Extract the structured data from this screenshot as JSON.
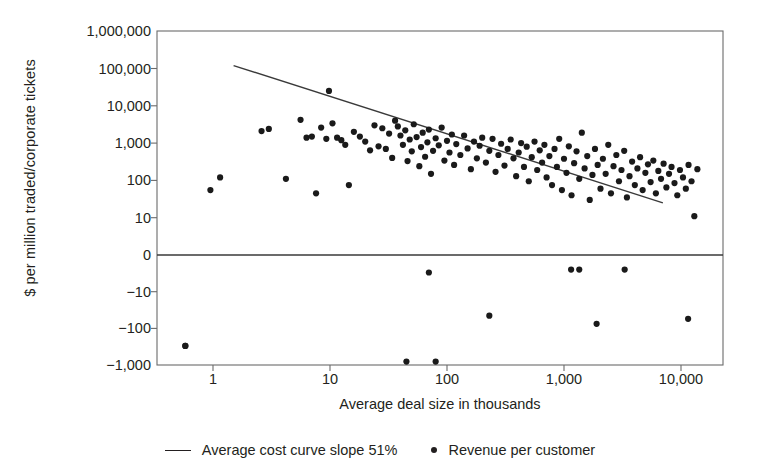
{
  "chart_data": {
    "type": "scatter",
    "title": "",
    "xlabel": "Average deal size in thousands",
    "ylabel": "$ per million traded/corporate tickets",
    "xscale": "log",
    "yscale": "symlog",
    "xlim": [
      0.45,
      17000
    ],
    "ylim": [
      -1000,
      1000000
    ],
    "grid": false,
    "legend_position": "bottom-center",
    "xticks": [
      {
        "value": 1,
        "label": "1"
      },
      {
        "value": 10,
        "label": "10"
      },
      {
        "value": 100,
        "label": "100"
      },
      {
        "value": 1000,
        "label": "1,000"
      },
      {
        "value": 10000,
        "label": "10,000"
      }
    ],
    "yticks": [
      {
        "value": 1000000,
        "label": "1,000,000"
      },
      {
        "value": 100000,
        "label": "100,000"
      },
      {
        "value": 10000,
        "label": "10,000"
      },
      {
        "value": 1000,
        "label": "1,000"
      },
      {
        "value": 100,
        "label": "100"
      },
      {
        "value": 10,
        "label": "10"
      },
      {
        "value": 0,
        "label": "0"
      },
      {
        "value": -10,
        "label": "−10"
      },
      {
        "value": -100,
        "label": "−100"
      },
      {
        "value": -1000,
        "label": "−1,000"
      }
    ],
    "legend": [
      {
        "marker": "line",
        "label": "Average cost curve slope 51%"
      },
      {
        "marker": "dot",
        "label": "Revenue per customer"
      }
    ],
    "series": [
      {
        "name": "Average cost curve slope 51%",
        "type": "line",
        "slope_percent": 51,
        "points": [
          {
            "x": 1.5,
            "y": 120000
          },
          {
            "x": 7000,
            "y": 25
          }
        ]
      },
      {
        "name": "Revenue per customer",
        "type": "scatter",
        "points": [
          {
            "x": 0.58,
            "y": -300
          },
          {
            "x": 0.95,
            "y": 55
          },
          {
            "x": 1.15,
            "y": 120
          },
          {
            "x": 2.6,
            "y": 2100
          },
          {
            "x": 3.0,
            "y": 2400
          },
          {
            "x": 4.2,
            "y": 110
          },
          {
            "x": 5.6,
            "y": 4200
          },
          {
            "x": 6.3,
            "y": 1400
          },
          {
            "x": 7.0,
            "y": 1500
          },
          {
            "x": 7.6,
            "y": 45
          },
          {
            "x": 8.4,
            "y": 2600
          },
          {
            "x": 9.3,
            "y": 1300
          },
          {
            "x": 9.8,
            "y": 25000
          },
          {
            "x": 10.5,
            "y": 3400
          },
          {
            "x": 11.5,
            "y": 1400
          },
          {
            "x": 12.5,
            "y": 1200
          },
          {
            "x": 13.5,
            "y": 900
          },
          {
            "x": 14.5,
            "y": 75
          },
          {
            "x": 16,
            "y": 2000
          },
          {
            "x": 18,
            "y": 1500
          },
          {
            "x": 20,
            "y": 1100
          },
          {
            "x": 22,
            "y": 640
          },
          {
            "x": 24,
            "y": 3000
          },
          {
            "x": 26,
            "y": 820
          },
          {
            "x": 28,
            "y": 2500
          },
          {
            "x": 30,
            "y": 700
          },
          {
            "x": 32,
            "y": 1800
          },
          {
            "x": 34,
            "y": 400
          },
          {
            "x": 36,
            "y": 4000
          },
          {
            "x": 38,
            "y": 2800
          },
          {
            "x": 40,
            "y": 1600
          },
          {
            "x": 42,
            "y": 900
          },
          {
            "x": 44,
            "y": 2200
          },
          {
            "x": 46,
            "y": 330
          },
          {
            "x": 48,
            "y": 1250
          },
          {
            "x": 50,
            "y": 600
          },
          {
            "x": 52,
            "y": 3200
          },
          {
            "x": 55,
            "y": 1450
          },
          {
            "x": 58,
            "y": 240
          },
          {
            "x": 60,
            "y": 780
          },
          {
            "x": 62,
            "y": 1900
          },
          {
            "x": 65,
            "y": 430
          },
          {
            "x": 68,
            "y": 1050
          },
          {
            "x": 70,
            "y": 2300
          },
          {
            "x": 73,
            "y": 150
          },
          {
            "x": 76,
            "y": 620
          },
          {
            "x": 80,
            "y": 1350
          },
          {
            "x": 85,
            "y": 870
          },
          {
            "x": 90,
            "y": 2600
          },
          {
            "x": 95,
            "y": 340
          },
          {
            "x": 100,
            "y": 1150
          },
          {
            "x": 105,
            "y": 560
          },
          {
            "x": 110,
            "y": 1700
          },
          {
            "x": 115,
            "y": 260
          },
          {
            "x": 120,
            "y": 940
          },
          {
            "x": 130,
            "y": 480
          },
          {
            "x": 140,
            "y": 1600
          },
          {
            "x": 150,
            "y": 720
          },
          {
            "x": 160,
            "y": 200
          },
          {
            "x": 170,
            "y": 1100
          },
          {
            "x": 180,
            "y": 390
          },
          {
            "x": 190,
            "y": 850
          },
          {
            "x": 200,
            "y": 1400
          },
          {
            "x": 215,
            "y": 300
          },
          {
            "x": 230,
            "y": 620
          },
          {
            "x": 245,
            "y": 1300
          },
          {
            "x": 260,
            "y": 170
          },
          {
            "x": 275,
            "y": 480
          },
          {
            "x": 290,
            "y": 960
          },
          {
            "x": 310,
            "y": 250
          },
          {
            "x": 330,
            "y": 700
          },
          {
            "x": 350,
            "y": 1250
          },
          {
            "x": 370,
            "y": 390
          },
          {
            "x": 390,
            "y": 130
          },
          {
            "x": 410,
            "y": 560
          },
          {
            "x": 430,
            "y": 1000
          },
          {
            "x": 455,
            "y": 230
          },
          {
            "x": 480,
            "y": 800
          },
          {
            "x": 500,
            "y": 95
          },
          {
            "x": 530,
            "y": 420
          },
          {
            "x": 560,
            "y": 1100
          },
          {
            "x": 590,
            "y": 190
          },
          {
            "x": 620,
            "y": 640
          },
          {
            "x": 650,
            "y": 300
          },
          {
            "x": 680,
            "y": 900
          },
          {
            "x": 710,
            "y": 120
          },
          {
            "x": 750,
            "y": 450
          },
          {
            "x": 790,
            "y": 75
          },
          {
            "x": 830,
            "y": 700
          },
          {
            "x": 870,
            "y": 230
          },
          {
            "x": 910,
            "y": 1300
          },
          {
            "x": 960,
            "y": 55
          },
          {
            "x": 1000,
            "y": 380
          },
          {
            "x": 1050,
            "y": 160
          },
          {
            "x": 1100,
            "y": 820
          },
          {
            "x": 1160,
            "y": 40
          },
          {
            "x": 1220,
            "y": 290
          },
          {
            "x": 1280,
            "y": 600
          },
          {
            "x": 1350,
            "y": 110
          },
          {
            "x": 1420,
            "y": 1900
          },
          {
            "x": 1500,
            "y": 210
          },
          {
            "x": 1580,
            "y": 450
          },
          {
            "x": 1660,
            "y": 30
          },
          {
            "x": 1750,
            "y": 140
          },
          {
            "x": 1840,
            "y": 700
          },
          {
            "x": 1940,
            "y": 260
          },
          {
            "x": 2050,
            "y": 60
          },
          {
            "x": 2150,
            "y": 380
          },
          {
            "x": 2270,
            "y": 150
          },
          {
            "x": 2390,
            "y": 900
          },
          {
            "x": 2520,
            "y": 45
          },
          {
            "x": 2650,
            "y": 240
          },
          {
            "x": 2800,
            "y": 480
          },
          {
            "x": 2950,
            "y": 95
          },
          {
            "x": 3100,
            "y": 190
          },
          {
            "x": 3270,
            "y": 620
          },
          {
            "x": 3450,
            "y": 35
          },
          {
            "x": 3630,
            "y": 130
          },
          {
            "x": 3820,
            "y": 320
          },
          {
            "x": 4030,
            "y": 75
          },
          {
            "x": 4240,
            "y": 210
          },
          {
            "x": 4470,
            "y": 420
          },
          {
            "x": 4700,
            "y": 55
          },
          {
            "x": 4960,
            "y": 160
          },
          {
            "x": 5220,
            "y": 270
          },
          {
            "x": 5500,
            "y": 90
          },
          {
            "x": 5800,
            "y": 340
          },
          {
            "x": 6100,
            "y": 45
          },
          {
            "x": 6400,
            "y": 180
          },
          {
            "x": 6750,
            "y": 110
          },
          {
            "x": 7100,
            "y": 280
          },
          {
            "x": 7500,
            "y": 65
          },
          {
            "x": 7900,
            "y": 150
          },
          {
            "x": 8300,
            "y": 230
          },
          {
            "x": 8800,
            "y": 85
          },
          {
            "x": 9300,
            "y": 40
          },
          {
            "x": 9800,
            "y": 190
          },
          {
            "x": 10400,
            "y": 120
          },
          {
            "x": 11000,
            "y": 60
          },
          {
            "x": 11600,
            "y": 260
          },
          {
            "x": 12300,
            "y": 95
          },
          {
            "x": 13000,
            "y": 11
          },
          {
            "x": 13800,
            "y": 200
          },
          {
            "x": 70,
            "y": -3
          },
          {
            "x": 230,
            "y": -45
          },
          {
            "x": 1150,
            "y": -2.5
          },
          {
            "x": 1350,
            "y": -2.5
          },
          {
            "x": 1900,
            "y": -75
          },
          {
            "x": 3300,
            "y": -2.5
          },
          {
            "x": 0.58,
            "y": -300
          },
          {
            "x": 45,
            "y": -800
          },
          {
            "x": 80,
            "y": -800
          },
          {
            "x": 11500,
            "y": -55
          }
        ]
      }
    ]
  }
}
